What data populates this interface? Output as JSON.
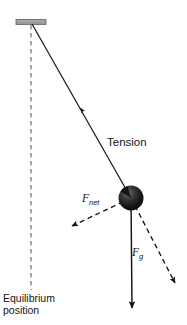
{
  "figure": {
    "type": "physics-free-body-diagram",
    "background_color": "#ffffff",
    "width": 187,
    "height": 325
  },
  "labels": {
    "tension": "Tension",
    "f_net_symbol": "F",
    "f_net_subscript": "net",
    "f_g_symbol": "F",
    "f_g_subscript": "g",
    "equilibrium_line1": "Equilibrium",
    "equilibrium_line2": "position"
  },
  "colors": {
    "ink": "#141414",
    "line": "#1a1a1a",
    "dashed_guide": "#8c8c8c",
    "ceiling_bar": "#9a9a9a",
    "ceiling_bar_edge": "#6e6e6e",
    "bob_dark": "#101010",
    "bob_mid": "#2e2e2e",
    "bob_highlight": "#6f6f6f"
  },
  "geometry": {
    "pivot": {
      "x": 32,
      "y": 24
    },
    "bob": {
      "cx": 131,
      "cy": 198,
      "r": 12.5
    },
    "ceiling_bar": {
      "x": 16,
      "y": 19.5,
      "width": 30,
      "height": 5
    },
    "equilibrium_line": {
      "x": 31,
      "y_top": 25,
      "y_bottom": 290
    },
    "tension_vector": {
      "from": {
        "x": 131,
        "y": 198
      },
      "to": {
        "x": 32,
        "y": 24
      },
      "arrow_at": {
        "x": 84,
        "y": 114
      },
      "style": "solid",
      "direction": "toward pivot"
    },
    "f_net_vector": {
      "from": {
        "x": 131,
        "y": 198
      },
      "to": {
        "x": 68,
        "y": 228
      },
      "style": "dashed",
      "direction": "down-left, tangent to arc"
    },
    "f_g_vector": {
      "from": {
        "x": 131,
        "y": 198
      },
      "to": {
        "x": 132,
        "y": 314
      },
      "style": "solid",
      "direction": "straight down"
    },
    "radial_component_vector": {
      "from": {
        "x": 131,
        "y": 198
      },
      "to": {
        "x": 179,
        "y": 290
      },
      "style": "dashed",
      "direction": "down-right, along string extension"
    }
  }
}
